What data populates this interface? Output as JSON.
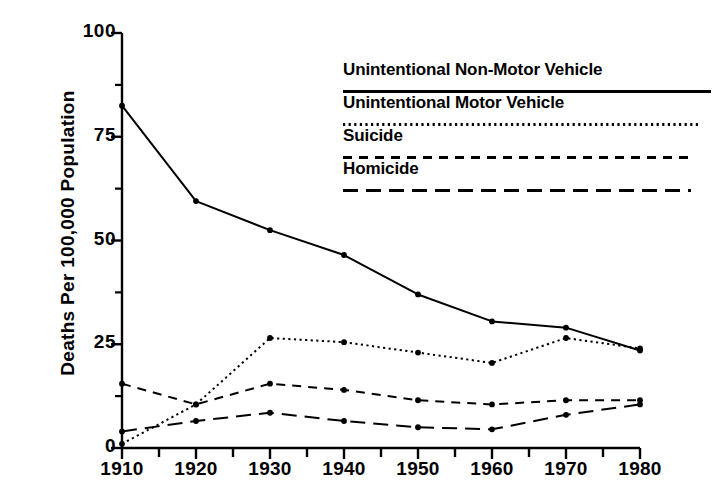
{
  "chart_data": {
    "type": "line",
    "title": "",
    "xlabel": "",
    "ylabel": "Deaths Per 100,000 Population",
    "x": [
      1910,
      1920,
      1930,
      1940,
      1950,
      1960,
      1970,
      1980
    ],
    "xtick_labels": [
      "1910",
      "1920",
      "1930",
      "1940",
      "1950",
      "1960",
      "1970",
      "1980"
    ],
    "ytick_labels": [
      "0",
      "25",
      "50",
      "75",
      "100"
    ],
    "yticks": [
      0,
      25,
      50,
      75,
      100
    ],
    "yminorticks": [
      12.5,
      37.5,
      62.5,
      87.5
    ],
    "xlim": [
      1910,
      1980
    ],
    "ylim": [
      0,
      100
    ],
    "xminor_interval": 5,
    "grid": false,
    "legend_position": "upper-right-inside",
    "markers": "filled-circle",
    "series": [
      {
        "name": "Unintentional Non-Motor Vehicle",
        "linestyle": "solid",
        "color": "#000000",
        "values": [
          82.5,
          59.5,
          52.5,
          46.5,
          37.0,
          30.5,
          29.0,
          23.5
        ]
      },
      {
        "name": "Unintentional Motor Vehicle",
        "linestyle": "dotted",
        "color": "#000000",
        "values": [
          1.0,
          10.5,
          26.5,
          25.5,
          23.0,
          20.5,
          26.5,
          24.0
        ]
      },
      {
        "name": "Suicide",
        "linestyle": "dashed",
        "color": "#000000",
        "values": [
          15.5,
          10.5,
          15.5,
          14.0,
          11.5,
          10.5,
          11.5,
          11.5
        ]
      },
      {
        "name": "Homicide",
        "linestyle": "longdash",
        "color": "#000000",
        "values": [
          4.0,
          6.5,
          8.5,
          6.5,
          5.0,
          4.5,
          8.0,
          10.5
        ]
      }
    ]
  },
  "legend": {
    "entries": [
      {
        "label": "Unintentional Non-Motor Vehicle",
        "linestyle": "solid"
      },
      {
        "label": "Unintentional Motor Vehicle",
        "linestyle": "dotted"
      },
      {
        "label": "Suicide",
        "linestyle": "dashed"
      },
      {
        "label": "Homicide",
        "linestyle": "longdash"
      }
    ]
  },
  "colors": {
    "background": "#ffffff",
    "foreground": "#000000"
  }
}
